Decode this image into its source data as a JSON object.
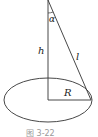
{
  "figure": {
    "caption": "图 3-22",
    "labels": {
      "angle": "α",
      "height": "h",
      "slant": "l",
      "radius": "R"
    },
    "colors": {
      "stroke": "#333333",
      "caption": "#9a9a9a"
    }
  }
}
